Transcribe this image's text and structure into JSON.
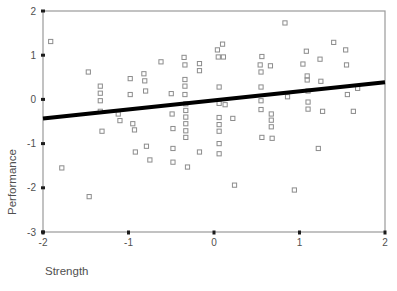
{
  "chart_data": {
    "type": "scatter",
    "title": "",
    "xlabel": "Strength",
    "ylabel": "Performance",
    "xlim": [
      -2,
      2
    ],
    "ylim": [
      -3,
      2
    ],
    "xticks": [
      -2,
      -1,
      0,
      1,
      2
    ],
    "yticks": [
      2,
      1,
      0,
      -1,
      -2,
      -3
    ],
    "xtick_labels": [
      "-2",
      "-1",
      "0",
      "1",
      "2"
    ],
    "ytick_labels": [
      "2",
      "1",
      "0",
      "-1",
      "-2",
      "-3"
    ],
    "grid": false,
    "legend": null,
    "marker": "open-square",
    "marker_color": "#8c8c8c",
    "frame_color": "#9a9a9a",
    "fit_line": {
      "type": "linear-regression",
      "color": "#000000",
      "width_px": 4,
      "x_start": -2,
      "y_start": -0.43,
      "x_end": 2,
      "y_end": 0.39,
      "slope": 0.205,
      "intercept": -0.02
    },
    "points": [
      [
        -1.91,
        1.31
      ],
      [
        -1.78,
        -1.55
      ],
      [
        -1.47,
        0.62
      ],
      [
        -1.46,
        -2.2
      ],
      [
        -1.33,
        0.3
      ],
      [
        -1.33,
        0.14
      ],
      [
        -1.33,
        -0.03
      ],
      [
        -1.33,
        -0.27
      ],
      [
        -1.31,
        -0.72
      ],
      [
        -1.12,
        -0.33
      ],
      [
        -1.1,
        -0.48
      ],
      [
        -0.98,
        0.47
      ],
      [
        -0.98,
        0.11
      ],
      [
        -0.95,
        -0.55
      ],
      [
        -0.93,
        -0.69
      ],
      [
        -0.92,
        -1.19
      ],
      [
        -0.82,
        0.58
      ],
      [
        -0.81,
        0.42
      ],
      [
        -0.8,
        0.19
      ],
      [
        -0.79,
        -1.06
      ],
      [
        -0.75,
        -1.37
      ],
      [
        -0.62,
        0.85
      ],
      [
        -0.5,
        0.13
      ],
      [
        -0.49,
        -0.33
      ],
      [
        -0.48,
        -0.66
      ],
      [
        -0.48,
        -1.11
      ],
      [
        -0.48,
        -1.42
      ],
      [
        -0.35,
        0.95
      ],
      [
        -0.34,
        0.78
      ],
      [
        -0.34,
        0.45
      ],
      [
        -0.34,
        0.3
      ],
      [
        -0.34,
        0.11
      ],
      [
        -0.33,
        -0.1
      ],
      [
        -0.33,
        -0.25
      ],
      [
        -0.33,
        -0.4
      ],
      [
        -0.33,
        -0.55
      ],
      [
        -0.33,
        -0.71
      ],
      [
        -0.33,
        -0.86
      ],
      [
        -0.31,
        -1.53
      ],
      [
        -0.17,
        0.81
      ],
      [
        -0.17,
        0.65
      ],
      [
        -0.17,
        -1.19
      ],
      [
        0.04,
        1.12
      ],
      [
        0.05,
        0.96
      ],
      [
        0.06,
        0.28
      ],
      [
        0.06,
        -0.09
      ],
      [
        0.06,
        -0.41
      ],
      [
        0.06,
        -0.57
      ],
      [
        0.06,
        -0.72
      ],
      [
        0.06,
        -1.0
      ],
      [
        0.06,
        -1.23
      ],
      [
        0.1,
        1.25
      ],
      [
        0.11,
        0.96
      ],
      [
        0.13,
        -0.12
      ],
      [
        0.22,
        -0.43
      ],
      [
        0.24,
        -1.94
      ],
      [
        0.54,
        0.78
      ],
      [
        0.55,
        0.62
      ],
      [
        0.55,
        0.28
      ],
      [
        0.55,
        -0.03
      ],
      [
        0.55,
        -0.23
      ],
      [
        0.56,
        -0.86
      ],
      [
        0.56,
        0.97
      ],
      [
        0.66,
        0.76
      ],
      [
        0.67,
        -0.33
      ],
      [
        0.67,
        -0.47
      ],
      [
        0.67,
        -0.62
      ],
      [
        0.68,
        -0.88
      ],
      [
        0.83,
        1.73
      ],
      [
        0.86,
        0.06
      ],
      [
        0.94,
        -2.05
      ],
      [
        1.04,
        0.8
      ],
      [
        1.08,
        1.09
      ],
      [
        1.09,
        0.53
      ],
      [
        1.09,
        0.44
      ],
      [
        1.1,
        0.19
      ],
      [
        1.1,
        -0.06
      ],
      [
        1.1,
        -0.22
      ],
      [
        1.22,
        -1.11
      ],
      [
        1.24,
        0.91
      ],
      [
        1.25,
        0.41
      ],
      [
        1.27,
        -0.27
      ],
      [
        1.4,
        1.29
      ],
      [
        1.54,
        1.12
      ],
      [
        1.55,
        0.78
      ],
      [
        1.56,
        0.11
      ],
      [
        1.63,
        -0.27
      ],
      [
        1.68,
        0.25
      ]
    ]
  },
  "axis": {
    "x_title": "Strength",
    "y_title": "Performance"
  }
}
